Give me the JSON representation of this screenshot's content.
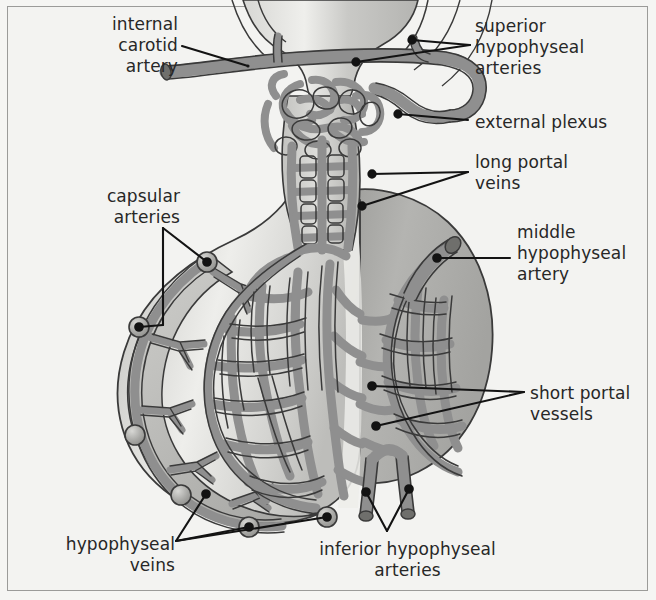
{
  "figure": {
    "background_color": "#f3f3f1",
    "frame_color": "#9b9b99",
    "vessel_color": "#8f8f8f",
    "vessel_outline_color": "#3a3a3a",
    "tissue_light_color": "#e2e2df",
    "tissue_mid_color": "#bdbdba",
    "tissue_dark_color": "#a8a8a5",
    "leader_color": "#131313",
    "text_color": "#272727"
  },
  "labels": [
    {
      "id": "internal-carotid-artery",
      "text": "internal\ncarotid\nartery",
      "align": "right",
      "x": 58,
      "y": 14,
      "width": 120
    },
    {
      "id": "capsular-arteries",
      "text": "capsular\narteries",
      "align": "right",
      "x": 95,
      "y": 186,
      "width": 85
    },
    {
      "id": "hypophyseal-veins",
      "text": "hypophyseal\nveins",
      "align": "right",
      "x": 35,
      "y": 534,
      "width": 140
    },
    {
      "id": "superior-hypophyseal-arteries",
      "text": "superior\nhypophyseal\narteries",
      "align": "left",
      "x": 475,
      "y": 16,
      "width": 160
    },
    {
      "id": "external-plexus",
      "text": "external plexus",
      "align": "left",
      "x": 475,
      "y": 112,
      "width": 170
    },
    {
      "id": "long-portal-veins",
      "text": "long portal\nveins",
      "align": "left",
      "x": 475,
      "y": 152,
      "width": 150
    },
    {
      "id": "middle-hypophyseal-artery",
      "text": "middle\nhypophyseal\nartery",
      "align": "left",
      "x": 517,
      "y": 222,
      "width": 135
    },
    {
      "id": "short-portal-vessels",
      "text": "short portal\nvessels",
      "align": "left",
      "x": 530,
      "y": 383,
      "width": 125
    },
    {
      "id": "inferior-hypophyseal-arteries",
      "text": "inferior hypophyseal\narteries",
      "align": "center",
      "x": 300,
      "y": 539,
      "width": 215
    }
  ],
  "structures": [
    {
      "id": "hypothalamus",
      "name": "hypothalamus"
    },
    {
      "id": "infundibular-stalk",
      "name": "infundibular stalk"
    },
    {
      "id": "anterior-lobe",
      "name": "anterior lobe (adenohypophysis)"
    },
    {
      "id": "posterior-lobe",
      "name": "posterior lobe (neurohypophysis)"
    },
    {
      "id": "primary-capillary-plexus",
      "name": "primary capillary plexus"
    },
    {
      "id": "secondary-capillary-plexus",
      "name": "secondary capillary plexus"
    }
  ]
}
